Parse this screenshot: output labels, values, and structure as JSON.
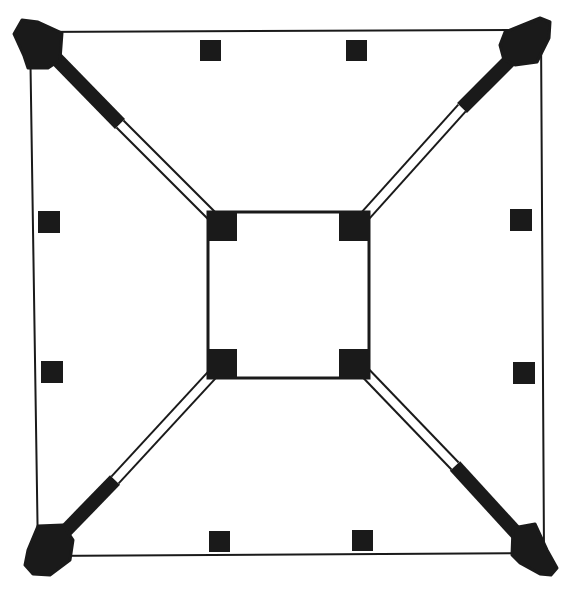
{
  "colors": {
    "background": "#ffffff",
    "ink": "#1a1a1a"
  },
  "outer_frame": {
    "corners": [
      [
        30,
        32
      ],
      [
        541,
        30
      ],
      [
        544,
        553
      ],
      [
        38,
        556
      ]
    ],
    "stroke_width": 2
  },
  "inner_frame": {
    "x": 208,
    "y": 212,
    "width": 161,
    "height": 166,
    "stroke_width": 3,
    "corner_blocks": [
      {
        "x": 207,
        "y": 211,
        "size": 30
      },
      {
        "x": 339,
        "y": 211,
        "size": 30
      },
      {
        "x": 207,
        "y": 349,
        "size": 30
      },
      {
        "x": 339,
        "y": 349,
        "size": 30
      }
    ]
  },
  "corner_anchors": [
    {
      "id": "top-left",
      "points": "14,34 22,20 38,22 62,33 60,60 48,68 28,68 24,56"
    },
    {
      "id": "top-right",
      "points": "505,32 540,18 550,22 549,38 537,62 515,65 504,60 500,45"
    },
    {
      "id": "bottom-left",
      "points": "38,526 63,525 73,540 70,560 50,575 33,574 25,565 28,550"
    },
    {
      "id": "bottom-right",
      "points": "513,528 535,524 547,550 557,568 551,575 540,574 520,563 512,555"
    }
  ],
  "struts": [
    {
      "id": "top-left",
      "from": [
        42,
        44
      ],
      "solid_to": [
        120,
        124
      ],
      "to": [
        222,
        226
      ]
    },
    {
      "id": "top-right",
      "from": [
        528,
        42
      ],
      "solid_to": [
        462,
        108
      ],
      "to": [
        356,
        226
      ]
    },
    {
      "id": "bottom-left",
      "from": [
        50,
        547
      ],
      "solid_to": [
        115,
        480
      ],
      "to": [
        222,
        364
      ]
    },
    {
      "id": "bottom-right",
      "from": [
        530,
        548
      ],
      "solid_to": [
        455,
        466
      ],
      "to": [
        355,
        362
      ]
    }
  ],
  "strut_style": {
    "solid_width": 14,
    "hollow_outer_width": 12,
    "hollow_inner_width": 8
  },
  "small_squares": [
    {
      "side": "top",
      "x": 200,
      "y": 40,
      "size": 21
    },
    {
      "side": "top",
      "x": 346,
      "y": 40,
      "size": 21
    },
    {
      "side": "left",
      "x": 38,
      "y": 211,
      "size": 22
    },
    {
      "side": "left",
      "x": 41,
      "y": 361,
      "size": 22
    },
    {
      "side": "right",
      "x": 510,
      "y": 209,
      "size": 22
    },
    {
      "side": "right",
      "x": 513,
      "y": 362,
      "size": 22
    },
    {
      "side": "bottom",
      "x": 209,
      "y": 531,
      "size": 21
    },
    {
      "side": "bottom",
      "x": 352,
      "y": 530,
      "size": 21
    }
  ]
}
